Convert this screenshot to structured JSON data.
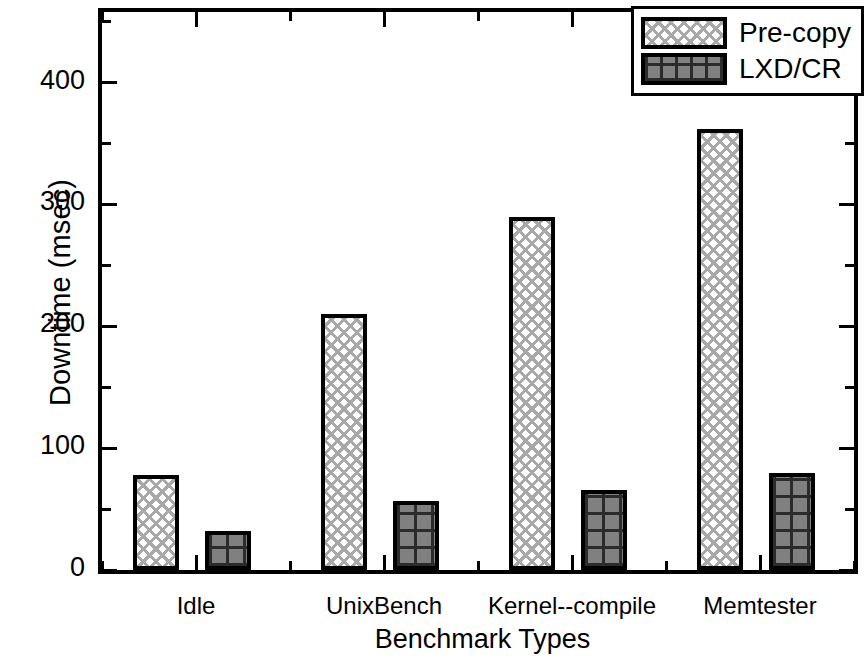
{
  "chart_data": {
    "type": "bar",
    "title": "",
    "xlabel": "Benchmark Types",
    "ylabel": "Downtime (msec)",
    "categories": [
      "Idle",
      "UnixBench",
      "Kernel--compile",
      "Memtester"
    ],
    "series": [
      {
        "name": "Pre-copy",
        "values": [
          78,
          210,
          290,
          362
        ]
      },
      {
        "name": "LXD/CR",
        "values": [
          32,
          57,
          66,
          80
        ]
      }
    ],
    "ylim": [
      0,
      458
    ],
    "ytick_labels": [
      "0",
      "100",
      "200",
      "300",
      "400"
    ],
    "ytick_values": [
      0,
      100,
      200,
      300,
      400
    ],
    "yminor_step": 50,
    "grid": false,
    "legend_position": "top-right",
    "frame": "box",
    "tick_direction": "in"
  },
  "legend": {
    "entries": [
      {
        "label": "Pre-copy",
        "pattern": "diagonal-crosshatch-light",
        "color": "#ffffff"
      },
      {
        "label": "LXD/CR",
        "pattern": "square-grid-dark",
        "color": "#808080"
      }
    ]
  }
}
